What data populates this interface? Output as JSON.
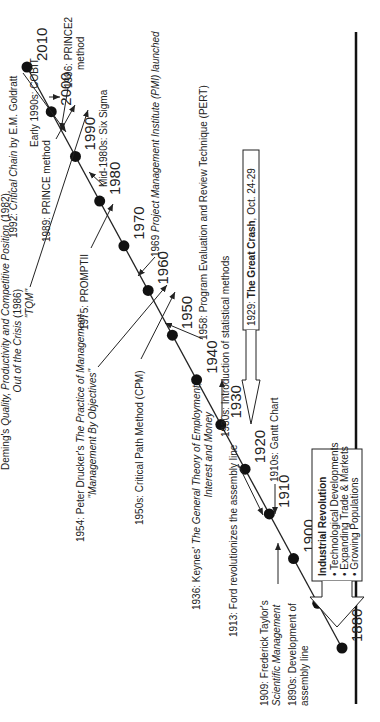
{
  "timeline": {
    "years": [
      "1880",
      "1890",
      "1900",
      "1910",
      "1920",
      "1930",
      "1940",
      "1950",
      "1960",
      "1970",
      "1980",
      "1990",
      "2000",
      "2010"
    ]
  },
  "events_above": {
    "deming": {
      "prefix": "Deming's ",
      "title1": "Quality, Productivity and Competitive Position",
      "suffix1": " (1982),",
      "title2": "Out of the Crisis",
      "suffix2": " (1986)",
      "tqm": "\"TQM\""
    },
    "drucker": {
      "prefix": "1954: Peter Drucker's ",
      "title": "The Practice of Management",
      "line2": "\"Management By Objectives\""
    },
    "cpm": "1950s: Critical Path Method (CPM)",
    "keynes": {
      "prefix": "1936: Keynes' ",
      "title1": "The General Theory of Employment,",
      "title2": "Interest and Money"
    },
    "ford": "1913: Ford revolutionizes the assembly line",
    "taylor": {
      "line1": "1909: Frederick Taylor's",
      "line2": "Scientific Management"
    },
    "assembly": {
      "line1": "1890s: Development of",
      "line2": "assembly line"
    },
    "goldratt": {
      "prefix": "1992: ",
      "title": "Critical Chain",
      "suffix": " by E.M. Goldratt"
    },
    "prince": "1989: PRINCE method",
    "promptii": "1975: PROMPTII"
  },
  "events_below": {
    "cobit": "Early 1990s: COBIT",
    "prince2": {
      "line1": "1996: PRINCE2",
      "line2": "method"
    },
    "six_sigma": "Mid-1980s: Six Sigma",
    "pmi": {
      "prefix": "1969 ",
      "title": "Project Management Institute (PMI) launched"
    },
    "pert": "1958: Program Evaluation and Review Technique (PERT)",
    "statistical": "1930s: Introduction of statistical methods",
    "gantt": "1910s: Gantt Chart",
    "crash": {
      "prefix": "1929: ",
      "bold": "The Great Crash",
      "suffix": ", Oct. 24-29"
    },
    "industrial": {
      "title": "Industrial Revolution",
      "bullets": [
        "Technological Developments",
        "Expanding Trade & Markets",
        "Growing Populations"
      ]
    }
  }
}
